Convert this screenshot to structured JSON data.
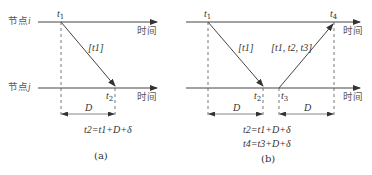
{
  "diagram": {
    "a": {
      "node_i_label": "节点",
      "node_i_var": "i",
      "node_j_label": "节点",
      "node_j_var": "j",
      "time_label_top": "时间",
      "time_label_bottom": "时间",
      "t1_var": "t",
      "t1_sub": "1",
      "t2_var": "t",
      "t2_sub": "2",
      "message_label": "[t1]",
      "D_label": "D",
      "equation": "t2=t1+D+δ",
      "caption": "(a)"
    },
    "b": {
      "time_label": "时间",
      "t1_var": "t",
      "t1_sub": "1",
      "t2_var": "t",
      "t2_sub": "2",
      "t3_var": "t",
      "t3_sub": "3",
      "t4_var": "t",
      "t4_sub": "4",
      "message1_label": "[t1]",
      "message2_label": "[t1, t2, t3]",
      "D1_label": "D",
      "D2_label": "D",
      "equation1": "t2=t1+D+δ",
      "equation2": "t4=t3+D+δ",
      "caption": "(b)"
    }
  }
}
